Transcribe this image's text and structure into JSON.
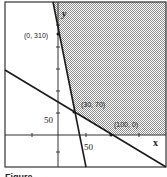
{
  "figure": {
    "y_axis_label": "y",
    "x_axis_label": "x",
    "tick_label_y": "50",
    "tick_label_x": "50",
    "points": [
      {
        "label": "(0, 310)"
      },
      {
        "label": "(30, 70)"
      },
      {
        "label": "(100, 0)"
      }
    ],
    "caption": "Figure ..."
  },
  "colors": {
    "line": "#1a1a1a",
    "shade": "#9a9a9a",
    "background": "#ffffff"
  }
}
